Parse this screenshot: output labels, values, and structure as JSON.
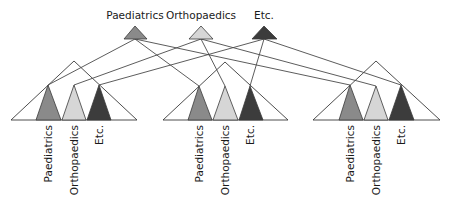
{
  "diagram": {
    "colors": {
      "paediatrics": "#8a8a8a",
      "orthopaedics": "#d6d6d6",
      "etc": "#3c3c3c",
      "line": "#4a4a4a"
    },
    "top_nodes": [
      {
        "label": "Paediatrics",
        "key": "paediatrics"
      },
      {
        "label": "Orthopaedics",
        "key": "orthopaedics"
      },
      {
        "label": "Etc.",
        "key": "etc"
      }
    ],
    "hierarchies": [
      {
        "name": "hierarchy-left",
        "children": [
          {
            "label": "Paediatrics",
            "key": "paediatrics"
          },
          {
            "label": "Orthopaedics",
            "key": "orthopaedics"
          },
          {
            "label": "Etc.",
            "key": "etc"
          }
        ]
      },
      {
        "name": "hierarchy-middle",
        "children": [
          {
            "label": "Paediatrics",
            "key": "paediatrics"
          },
          {
            "label": "Orthopaedics",
            "key": "orthopaedics"
          },
          {
            "label": "Etc.",
            "key": "etc"
          }
        ]
      },
      {
        "name": "hierarchy-right",
        "children": [
          {
            "label": "Paediatrics",
            "key": "paediatrics"
          },
          {
            "label": "Orthopaedics",
            "key": "orthopaedics"
          },
          {
            "label": "Etc.",
            "key": "etc"
          }
        ]
      }
    ]
  }
}
